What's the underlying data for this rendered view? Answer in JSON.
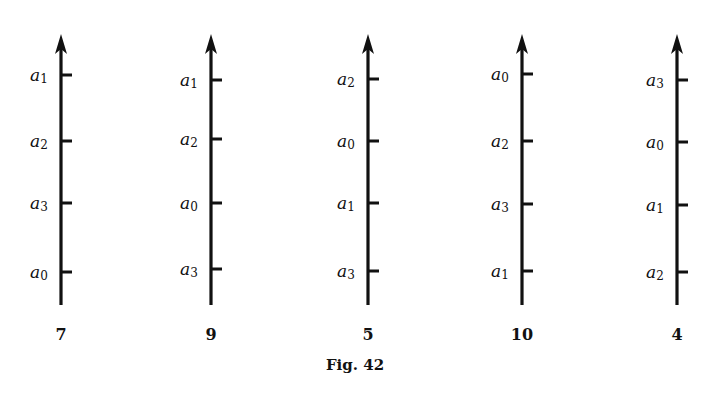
{
  "figure": {
    "caption": "Fig. 42",
    "axes": [
      {
        "x": 61,
        "number": "7",
        "ticks": [
          {
            "y": 75,
            "var": "a",
            "sub": "1"
          },
          {
            "y": 141,
            "var": "a",
            "sub": "2"
          },
          {
            "y": 203,
            "var": "a",
            "sub": "3"
          },
          {
            "y": 272,
            "var": "a",
            "sub": "0"
          }
        ]
      },
      {
        "x": 211,
        "number": "9",
        "ticks": [
          {
            "y": 80,
            "var": "a",
            "sub": "1"
          },
          {
            "y": 139,
            "var": "a",
            "sub": "2"
          },
          {
            "y": 203,
            "var": "a",
            "sub": "0"
          },
          {
            "y": 269,
            "var": "a",
            "sub": "3"
          }
        ]
      },
      {
        "x": 368,
        "number": "5",
        "ticks": [
          {
            "y": 79,
            "var": "a",
            "sub": "2"
          },
          {
            "y": 141,
            "var": "a",
            "sub": "0"
          },
          {
            "y": 203,
            "var": "a",
            "sub": "1"
          },
          {
            "y": 271,
            "var": "a",
            "sub": "3"
          }
        ]
      },
      {
        "x": 522,
        "number": "10",
        "ticks": [
          {
            "y": 74,
            "var": "a",
            "sub": "0"
          },
          {
            "y": 141,
            "var": "a",
            "sub": "2"
          },
          {
            "y": 204,
            "var": "a",
            "sub": "3"
          },
          {
            "y": 271,
            "var": "a",
            "sub": "1"
          }
        ]
      },
      {
        "x": 677,
        "number": "4",
        "ticks": [
          {
            "y": 80,
            "var": "a",
            "sub": "3"
          },
          {
            "y": 142,
            "var": "a",
            "sub": "0"
          },
          {
            "y": 205,
            "var": "a",
            "sub": "1"
          },
          {
            "y": 272,
            "var": "a",
            "sub": "2"
          }
        ]
      }
    ]
  }
}
